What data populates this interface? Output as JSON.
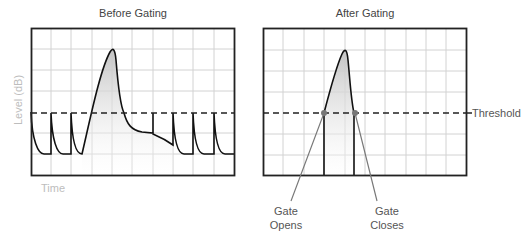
{
  "left_panel": {
    "title": "Before Gating",
    "y_axis_label": "Level (dB)",
    "x_axis_label": "Time"
  },
  "right_panel": {
    "title": "After Gating",
    "threshold_label": "Threshold",
    "gate_opens_label_1": "Gate",
    "gate_opens_label_2": "Opens",
    "gate_closes_label_1": "Gate",
    "gate_closes_label_2": "Closes"
  },
  "colors": {
    "frame": "#222222",
    "grid": "#d0d0d0",
    "signal": "#111111",
    "fill": "#c8c8c8",
    "leader": "#777777",
    "axis_label": "#bdbdbd"
  }
}
